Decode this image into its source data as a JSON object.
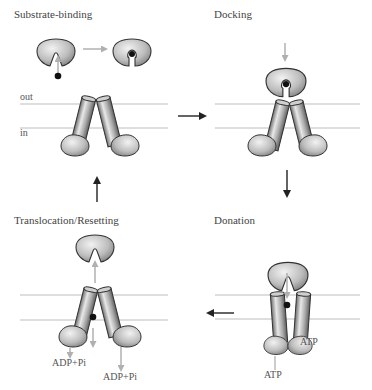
{
  "colors": {
    "membrane_line": "#bdbdbd",
    "protein_fill_light": "#e6e6e6",
    "protein_fill_dark": "#8a8a8a",
    "protein_stroke": "#333333",
    "gray_arrow": "#b0b0b0",
    "black_arrow": "#222222",
    "substrate": "#111111"
  },
  "panels": [
    {
      "id": "substrate-binding",
      "label": "Substrate-binding",
      "membrane_labels": {
        "out": "out",
        "in": "in"
      }
    },
    {
      "id": "docking",
      "label": "Docking"
    },
    {
      "id": "donation",
      "label": "Donation",
      "annotations": [
        "ATP",
        "ATP"
      ]
    },
    {
      "id": "translocation-resetting",
      "label": "Translocation/Resetting",
      "annotations": [
        "ADP+Pi",
        "ADP+Pi"
      ]
    }
  ],
  "cycle_arrows": [
    {
      "from": "substrate-binding",
      "to": "docking",
      "direction": "right"
    },
    {
      "from": "docking",
      "to": "donation",
      "direction": "down"
    },
    {
      "from": "donation",
      "to": "translocation-resetting",
      "direction": "left"
    },
    {
      "from": "translocation-resetting",
      "to": "substrate-binding",
      "direction": "up"
    }
  ]
}
